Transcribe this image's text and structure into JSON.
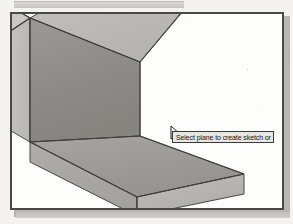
{
  "app": {
    "kind": "cad-modeler-viewport",
    "viewport_background": "#fdfdfc",
    "frame_color": "#4a4845"
  },
  "tooltip": {
    "text": "Select plane to create sketch or",
    "background": "#e8e6e2",
    "border_color": "#3b3a38",
    "text_color": "#15140f",
    "truncated": true
  },
  "cursor": {
    "icon": "arrow-pointer-with-sketch-plane-badge",
    "x": 158,
    "y": 112
  },
  "model": {
    "name": "L-shaped-bracket",
    "shading": "flat-gray-shaded",
    "edge_color": "#4a4845",
    "faces": [
      {
        "name": "base-top-face",
        "state": "highlighted",
        "color": "#9d9c98"
      },
      {
        "name": "base-front-face",
        "state": "normal",
        "color": "#a8a7a3"
      },
      {
        "name": "base-right-face",
        "state": "normal",
        "color": "#b6b5b1"
      },
      {
        "name": "wall-inner-face",
        "state": "normal",
        "color": "#8f8e8a"
      },
      {
        "name": "wall-left-face",
        "state": "normal",
        "color": "#c2c1bd"
      },
      {
        "name": "wall-top-face",
        "state": "normal",
        "color": "#bdbcb8"
      },
      {
        "name": "wall-front-face",
        "state": "normal",
        "color": "#b0afab"
      }
    ]
  },
  "toolbar_strip": {
    "visible": true,
    "label": "partial-toolbar-edge"
  }
}
